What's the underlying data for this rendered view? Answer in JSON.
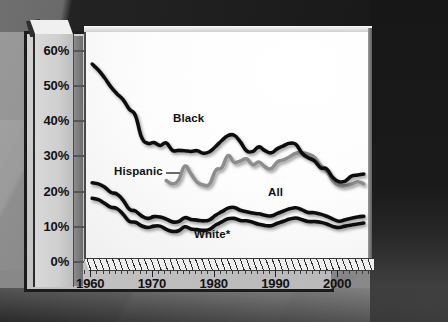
{
  "chart_data": {
    "type": "line",
    "title": "",
    "subtitle": "",
    "xlabel": "",
    "ylabel": "",
    "xlim": [
      1959,
      2005
    ],
    "ylim": [
      0,
      65
    ],
    "grid": false,
    "legend_position": "inline-annotations",
    "x_tick_labels": [
      "1960",
      "1970",
      "1980",
      "1990",
      "2000"
    ],
    "x_tick_values": [
      1960,
      1970,
      1980,
      1990,
      2000
    ],
    "y_tick_labels": [
      "0%",
      "10%",
      "20%",
      "30%",
      "40%",
      "50%",
      "60%"
    ],
    "y_tick_values": [
      0,
      10,
      20,
      30,
      40,
      50,
      60
    ],
    "y_unit": "%",
    "minor_tick_interval_years": 1,
    "annotations": [
      {
        "text": "Black",
        "series": "Black"
      },
      {
        "text": "Hispanic",
        "series": "Hispanic",
        "has_leader_line": true
      },
      {
        "text": "All",
        "series": "All"
      },
      {
        "text": "White*",
        "series": "White"
      }
    ],
    "series": [
      {
        "name": "Black",
        "color": "#111111",
        "x": [
          1960,
          1961,
          1962,
          1963,
          1964,
          1965,
          1966,
          1967,
          1968,
          1969,
          1970,
          1971,
          1972,
          1973,
          1974,
          1975,
          1976,
          1977,
          1978,
          1979,
          1980,
          1981,
          1982,
          1983,
          1984,
          1985,
          1986,
          1987,
          1988,
          1989,
          1990,
          1991,
          1992,
          1993,
          1994,
          1995,
          1996,
          1997,
          1998,
          1999,
          2000,
          2001,
          2002,
          2003,
          2004
        ],
        "values": [
          55.9,
          54.2,
          52.0,
          49.5,
          47.5,
          45.8,
          43.1,
          41.3,
          35.1,
          33.4,
          33.6,
          32.8,
          33.5,
          31.4,
          31.4,
          31.3,
          31.1,
          31.3,
          30.6,
          31.0,
          32.5,
          34.2,
          35.6,
          35.7,
          33.8,
          31.3,
          31.1,
          32.4,
          31.3,
          30.7,
          31.9,
          32.7,
          33.4,
          33.1,
          30.6,
          29.3,
          28.4,
          26.5,
          26.1,
          23.6,
          22.5,
          22.7,
          24.1,
          24.4,
          24.7
        ]
      },
      {
        "name": "Hispanic",
        "color": "#8d8d8d",
        "x": [
          1972,
          1973,
          1974,
          1975,
          1976,
          1977,
          1978,
          1979,
          1980,
          1981,
          1982,
          1983,
          1984,
          1985,
          1986,
          1987,
          1988,
          1989,
          1990,
          1991,
          1992,
          1993,
          1994,
          1995,
          1996,
          1997,
          1998,
          1999,
          2000,
          2001,
          2002,
          2003,
          2004
        ],
        "values": [
          22.8,
          21.9,
          23.0,
          26.9,
          24.7,
          22.4,
          21.6,
          21.8,
          25.7,
          26.5,
          29.9,
          28.0,
          28.4,
          29.0,
          27.3,
          28.1,
          26.7,
          26.2,
          28.1,
          28.7,
          29.6,
          30.6,
          30.7,
          30.3,
          29.4,
          27.1,
          25.6,
          22.7,
          21.5,
          21.4,
          21.8,
          22.5,
          21.9
        ]
      },
      {
        "name": "All",
        "color": "#111111",
        "x": [
          1960,
          1961,
          1962,
          1963,
          1964,
          1965,
          1966,
          1967,
          1968,
          1969,
          1970,
          1971,
          1972,
          1973,
          1974,
          1975,
          1976,
          1977,
          1978,
          1979,
          1980,
          1981,
          1982,
          1983,
          1984,
          1985,
          1986,
          1987,
          1988,
          1989,
          1990,
          1991,
          1992,
          1993,
          1994,
          1995,
          1996,
          1997,
          1998,
          1999,
          2000,
          2001,
          2002,
          2003,
          2004
        ],
        "values": [
          22.2,
          21.9,
          21.0,
          19.5,
          19.0,
          17.3,
          14.7,
          14.2,
          12.8,
          12.1,
          12.6,
          12.5,
          11.9,
          11.1,
          11.2,
          12.3,
          11.8,
          11.6,
          11.4,
          11.7,
          13.0,
          14.0,
          15.0,
          15.2,
          14.4,
          14.0,
          13.6,
          13.4,
          13.0,
          12.8,
          13.5,
          14.2,
          14.8,
          15.1,
          14.5,
          13.8,
          13.7,
          13.3,
          12.7,
          11.9,
          11.3,
          11.7,
          12.1,
          12.5,
          12.7
        ]
      },
      {
        "name": "White",
        "color": "#111111",
        "note": "*",
        "x": [
          1960,
          1961,
          1962,
          1963,
          1964,
          1965,
          1966,
          1967,
          1968,
          1969,
          1970,
          1971,
          1972,
          1973,
          1974,
          1975,
          1976,
          1977,
          1978,
          1979,
          1980,
          1981,
          1982,
          1983,
          1984,
          1985,
          1986,
          1987,
          1988,
          1989,
          1990,
          1991,
          1992,
          1993,
          1994,
          1995,
          1996,
          1997,
          1998,
          1999,
          2000,
          2001,
          2002,
          2003,
          2004
        ],
        "values": [
          17.8,
          17.4,
          16.4,
          15.3,
          14.9,
          13.3,
          11.3,
          11.0,
          10.0,
          9.5,
          9.9,
          9.9,
          9.0,
          8.4,
          8.6,
          9.7,
          9.1,
          8.9,
          8.7,
          9.0,
          10.2,
          11.1,
          12.0,
          12.1,
          11.5,
          11.4,
          11.0,
          10.4,
          10.1,
          10.0,
          10.7,
          11.3,
          11.9,
          12.2,
          11.7,
          11.2,
          11.2,
          11.0,
          10.5,
          9.8,
          9.5,
          9.9,
          10.2,
          10.5,
          10.8
        ]
      }
    ]
  },
  "axes": {
    "y_title": "",
    "x_title": ""
  }
}
